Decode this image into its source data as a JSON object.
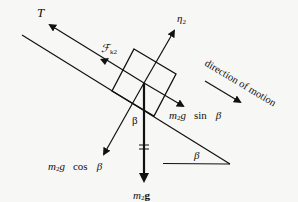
{
  "diagram": {
    "type": "free-body-diagram",
    "colors": {
      "ink": "#111111",
      "background": "#f7f7f5"
    },
    "labels": {
      "tension": "T",
      "friction": "ℱ",
      "friction_sub": "k2",
      "normal": "η",
      "normal_sub": "2",
      "weight_m": "m",
      "weight_sub": "2",
      "weight_g": "g",
      "parallel_m": "m",
      "parallel_sub": "2",
      "parallel_g": "g",
      "parallel_fn": "sin",
      "parallel_angle": "β",
      "perp_m": "m",
      "perp_sub": "2",
      "perp_g": "g",
      "perp_fn": "cos",
      "perp_angle": "β",
      "angle_at_block": "β",
      "incline_angle": "β",
      "motion_text": "direction  of  motion"
    },
    "forces": [
      {
        "name": "tension",
        "label": "T",
        "direction": "up-slope"
      },
      {
        "name": "kinetic-friction",
        "label": "Fk2",
        "direction": "up-slope"
      },
      {
        "name": "normal",
        "label": "η2",
        "direction": "perpendicular-out"
      },
      {
        "name": "weight",
        "label": "m2g",
        "direction": "down"
      },
      {
        "name": "weight-parallel",
        "label": "m2g sin β",
        "direction": "down-slope"
      },
      {
        "name": "weight-perpendicular",
        "label": "m2g cos β",
        "direction": "into-plane"
      }
    ]
  }
}
